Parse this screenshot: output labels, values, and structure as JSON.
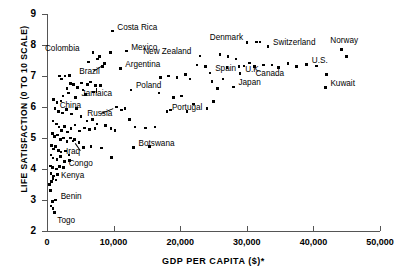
{
  "chart_data": {
    "type": "scatter",
    "title": "",
    "xlabel": "GDP PER CAPITA ($)*",
    "ylabel": "LIFE SATISFACTION (0 TO 10 SCALE)",
    "xlim": [
      0,
      50000
    ],
    "ylim": [
      2,
      9
    ],
    "xticks": [
      0,
      10000,
      20000,
      30000,
      40000,
      50000
    ],
    "xticklabels": [
      "0",
      "10,000",
      "20,000",
      "30,000",
      "40,000",
      "50,000"
    ],
    "yticks": [
      2,
      3,
      4,
      5,
      6,
      7,
      8,
      9
    ],
    "yticklabels": [
      "2",
      "3",
      "4",
      "5",
      "6",
      "7",
      "8",
      "9"
    ],
    "grid": false,
    "legend": null,
    "marker": "square",
    "marker_color": "#000000",
    "labeled_points": [
      {
        "name": "Costa Rica",
        "x": 9800,
        "y": 8.45,
        "dx": 5,
        "dy": -3.5,
        "leader": false
      },
      {
        "name": "Colombia",
        "x": 6900,
        "y": 7.75,
        "dx": -48,
        "dy": -3.5,
        "leader": false
      },
      {
        "name": "Mexico",
        "x": 11900,
        "y": 7.8,
        "dx": 5,
        "dy": -3.5,
        "leader": false
      },
      {
        "name": "Brazil",
        "x": 8600,
        "y": 7.4,
        "dx": -25,
        "dy": 8,
        "leader": true
      },
      {
        "name": "Argentina",
        "x": 11000,
        "y": 7.25,
        "dx": 5,
        "dy": -3.5,
        "leader": false
      },
      {
        "name": "Jamaica",
        "x": 7300,
        "y": 6.7,
        "dx": -14,
        "dy": 9,
        "leader": true
      },
      {
        "name": "Poland",
        "x": 12600,
        "y": 6.55,
        "dx": 5,
        "dy": -3.5,
        "leader": false
      },
      {
        "name": "China",
        "x": 4300,
        "y": 6.3,
        "dx": -16,
        "dy": 8,
        "leader": false
      },
      {
        "name": "Russia",
        "x": 10400,
        "y": 6.0,
        "dx": -29,
        "dy": 7,
        "leader": true
      },
      {
        "name": "Portugal",
        "x": 18000,
        "y": 5.85,
        "dx": 5,
        "dy": -3.5,
        "leader": false
      },
      {
        "name": "Iraq",
        "x": 3900,
        "y": 4.9,
        "dx": -7,
        "dy": 11,
        "leader": true
      },
      {
        "name": "Botswana",
        "x": 13000,
        "y": 4.7,
        "dx": 5,
        "dy": -3.5,
        "leader": false
      },
      {
        "name": "Congo",
        "x": 2500,
        "y": 4.05,
        "dx": 5,
        "dy": -3.5,
        "leader": false
      },
      {
        "name": "Kenya",
        "x": 1350,
        "y": 3.65,
        "dx": 5,
        "dy": -3.5,
        "leader": false
      },
      {
        "name": "Benin",
        "x": 1300,
        "y": 3.0,
        "dx": 5,
        "dy": -3.5,
        "leader": false
      },
      {
        "name": "Togo",
        "x": 1100,
        "y": 2.6,
        "dx": 3,
        "dy": 9,
        "leader": false
      },
      {
        "name": "New Zealand",
        "x": 23000,
        "y": 7.65,
        "dx": -57,
        "dy": -4,
        "leader": false
      },
      {
        "name": "Denmark",
        "x": 31500,
        "y": 8.1,
        "dx": -47,
        "dy": -3.5,
        "leader": false
      },
      {
        "name": "Switzerland",
        "x": 33200,
        "y": 7.95,
        "dx": 5,
        "dy": -3.5,
        "leader": false
      },
      {
        "name": "Norway",
        "x": 44200,
        "y": 7.85,
        "dx": -11,
        "dy": -8.5,
        "leader": false
      },
      {
        "name": "Spain",
        "x": 24500,
        "y": 7.1,
        "dx": 5,
        "dy": -3.5,
        "leader": false
      },
      {
        "name": "U.K.",
        "x": 29000,
        "y": 7.08,
        "dx": 5,
        "dy": -3.5,
        "leader": false
      },
      {
        "name": "Canada",
        "x": 32500,
        "y": 7.35,
        "dx": -8,
        "dy": 9,
        "leader": false
      },
      {
        "name": "U.S.",
        "x": 39000,
        "y": 7.38,
        "dx": 5,
        "dy": -3.5,
        "leader": false
      },
      {
        "name": "Kuwait",
        "x": 41800,
        "y": 6.62,
        "dx": 5,
        "dy": -3.5,
        "leader": false
      },
      {
        "name": "Japan",
        "x": 28000,
        "y": 6.65,
        "dx": 5,
        "dy": -3.5,
        "leader": false
      }
    ],
    "unlabeled_points": [
      {
        "x": 1000,
        "y": 6.25
      },
      {
        "x": 1500,
        "y": 6.15
      },
      {
        "x": 2100,
        "y": 6.2
      },
      {
        "x": 2400,
        "y": 6.35
      },
      {
        "x": 3200,
        "y": 6.45
      },
      {
        "x": 3000,
        "y": 6.6
      },
      {
        "x": 3500,
        "y": 6.75
      },
      {
        "x": 4000,
        "y": 6.72
      },
      {
        "x": 4600,
        "y": 6.62
      },
      {
        "x": 5200,
        "y": 6.78
      },
      {
        "x": 6100,
        "y": 6.72
      },
      {
        "x": 6500,
        "y": 6.8
      },
      {
        "x": 8000,
        "y": 6.7
      },
      {
        "x": 2700,
        "y": 7.0
      },
      {
        "x": 3400,
        "y": 7.02
      },
      {
        "x": 1900,
        "y": 7.0
      },
      {
        "x": 2200,
        "y": 6.9
      },
      {
        "x": 7600,
        "y": 7.55
      },
      {
        "x": 7900,
        "y": 7.62
      },
      {
        "x": 9500,
        "y": 7.75
      },
      {
        "x": 8300,
        "y": 7.3
      },
      {
        "x": 6200,
        "y": 7.45
      },
      {
        "x": 5400,
        "y": 6.55
      },
      {
        "x": 5800,
        "y": 6.4
      },
      {
        "x": 7000,
        "y": 6.48
      },
      {
        "x": 1200,
        "y": 5.95
      },
      {
        "x": 1700,
        "y": 5.85
      },
      {
        "x": 2300,
        "y": 5.8
      },
      {
        "x": 2900,
        "y": 5.92
      },
      {
        "x": 3700,
        "y": 5.78
      },
      {
        "x": 4400,
        "y": 5.95
      },
      {
        "x": 5100,
        "y": 5.7
      },
      {
        "x": 6000,
        "y": 5.55
      },
      {
        "x": 6800,
        "y": 5.6
      },
      {
        "x": 7500,
        "y": 5.45
      },
      {
        "x": 8800,
        "y": 5.4
      },
      {
        "x": 9600,
        "y": 5.3
      },
      {
        "x": 11200,
        "y": 5.9
      },
      {
        "x": 11700,
        "y": 5.95
      },
      {
        "x": 12400,
        "y": 5.6
      },
      {
        "x": 13200,
        "y": 5.35
      },
      {
        "x": 10200,
        "y": 5.25
      },
      {
        "x": 900,
        "y": 5.55
      },
      {
        "x": 1400,
        "y": 5.45
      },
      {
        "x": 1800,
        "y": 5.35
      },
      {
        "x": 2200,
        "y": 5.25
      },
      {
        "x": 2600,
        "y": 5.38
      },
      {
        "x": 3100,
        "y": 5.2
      },
      {
        "x": 3600,
        "y": 5.3
      },
      {
        "x": 4200,
        "y": 5.42
      },
      {
        "x": 4900,
        "y": 5.22
      },
      {
        "x": 5600,
        "y": 5.32
      },
      {
        "x": 6400,
        "y": 5.28
      },
      {
        "x": 7200,
        "y": 5.3
      },
      {
        "x": 800,
        "y": 5.15
      },
      {
        "x": 1100,
        "y": 5.05
      },
      {
        "x": 1600,
        "y": 5.1
      },
      {
        "x": 2000,
        "y": 4.95
      },
      {
        "x": 2500,
        "y": 5.0
      },
      {
        "x": 3000,
        "y": 4.88
      },
      {
        "x": 3500,
        "y": 5.0
      },
      {
        "x": 4100,
        "y": 4.95
      },
      {
        "x": 4800,
        "y": 4.85
      },
      {
        "x": 5500,
        "y": 4.7
      },
      {
        "x": 6600,
        "y": 4.72
      },
      {
        "x": 8200,
        "y": 4.68
      },
      {
        "x": 9700,
        "y": 4.38
      },
      {
        "x": 700,
        "y": 4.75
      },
      {
        "x": 1000,
        "y": 4.65
      },
      {
        "x": 1300,
        "y": 4.72
      },
      {
        "x": 1700,
        "y": 4.6
      },
      {
        "x": 2100,
        "y": 4.55
      },
      {
        "x": 2800,
        "y": 4.58
      },
      {
        "x": 3300,
        "y": 4.45
      },
      {
        "x": 600,
        "y": 4.45
      },
      {
        "x": 900,
        "y": 4.35
      },
      {
        "x": 1500,
        "y": 4.3
      },
      {
        "x": 2000,
        "y": 4.4
      },
      {
        "x": 2600,
        "y": 4.25
      },
      {
        "x": 3400,
        "y": 4.28
      },
      {
        "x": 500,
        "y": 4.1
      },
      {
        "x": 800,
        "y": 4.05
      },
      {
        "x": 1400,
        "y": 4.0
      },
      {
        "x": 1900,
        "y": 4.08
      },
      {
        "x": 600,
        "y": 3.85
      },
      {
        "x": 1000,
        "y": 3.78
      },
      {
        "x": 1600,
        "y": 3.82
      },
      {
        "x": 700,
        "y": 3.6
      },
      {
        "x": 400,
        "y": 3.5
      },
      {
        "x": 900,
        "y": 3.7
      },
      {
        "x": 500,
        "y": 3.3
      },
      {
        "x": 800,
        "y": 2.95
      },
      {
        "x": 600,
        "y": 2.8
      },
      {
        "x": 900,
        "y": 2.72
      },
      {
        "x": 14800,
        "y": 5.32
      },
      {
        "x": 16200,
        "y": 5.35
      },
      {
        "x": 15400,
        "y": 4.72
      },
      {
        "x": 17000,
        "y": 6.95
      },
      {
        "x": 18200,
        "y": 7.0
      },
      {
        "x": 19500,
        "y": 6.95
      },
      {
        "x": 20800,
        "y": 7.05
      },
      {
        "x": 21500,
        "y": 6.9
      },
      {
        "x": 19000,
        "y": 6.3
      },
      {
        "x": 20200,
        "y": 6.35
      },
      {
        "x": 18500,
        "y": 5.9
      },
      {
        "x": 21000,
        "y": 5.85
      },
      {
        "x": 22500,
        "y": 7.35
      },
      {
        "x": 23800,
        "y": 7.3
      },
      {
        "x": 24800,
        "y": 6.82
      },
      {
        "x": 25600,
        "y": 6.6
      },
      {
        "x": 26400,
        "y": 6.9
      },
      {
        "x": 26000,
        "y": 7.7
      },
      {
        "x": 27200,
        "y": 7.62
      },
      {
        "x": 28400,
        "y": 7.55
      },
      {
        "x": 27000,
        "y": 7.28
      },
      {
        "x": 28800,
        "y": 7.3
      },
      {
        "x": 29600,
        "y": 7.32
      },
      {
        "x": 30400,
        "y": 7.42
      },
      {
        "x": 31200,
        "y": 7.3
      },
      {
        "x": 30000,
        "y": 8.08
      },
      {
        "x": 32000,
        "y": 8.1
      },
      {
        "x": 33800,
        "y": 7.35
      },
      {
        "x": 34800,
        "y": 7.28
      },
      {
        "x": 36200,
        "y": 7.4
      },
      {
        "x": 37500,
        "y": 7.3
      },
      {
        "x": 40500,
        "y": 7.32
      },
      {
        "x": 42000,
        "y": 7.05
      },
      {
        "x": 45000,
        "y": 7.62
      },
      {
        "x": 22000,
        "y": 6.1
      },
      {
        "x": 25000,
        "y": 6.18
      },
      {
        "x": 24000,
        "y": 5.95
      },
      {
        "x": 16800,
        "y": 6.45
      }
    ]
  }
}
